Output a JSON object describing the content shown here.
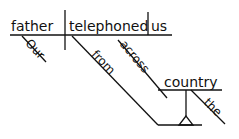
{
  "diagram": {
    "type": "sentence-diagram",
    "sentence": "Our father telephoned us from across the country",
    "subject": "father",
    "verb": "telephoned",
    "object": "us",
    "modifiers": {
      "subject_modifier": "Our",
      "preposition_1": "from",
      "preposition_2": "across",
      "prep_object": "country",
      "article": "the"
    },
    "line_color": "#111111"
  }
}
